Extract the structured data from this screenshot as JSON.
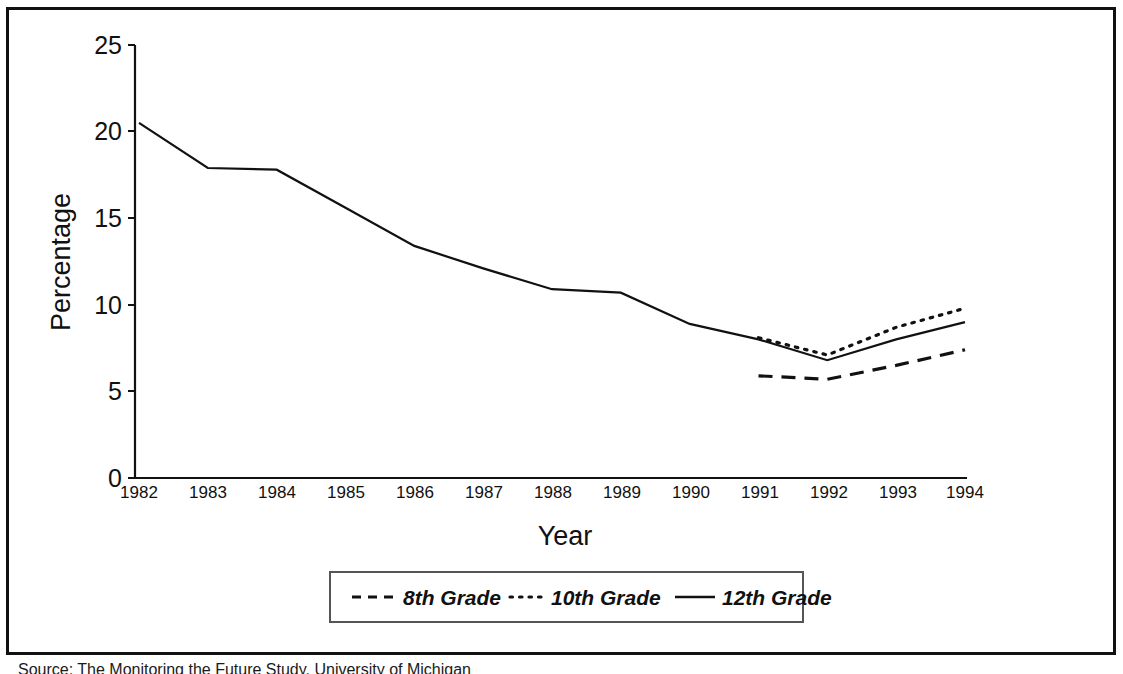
{
  "chart_data": {
    "type": "line",
    "title": "",
    "xlabel": "Year",
    "ylabel": "Percentage",
    "x": [
      1982,
      1983,
      1984,
      1985,
      1986,
      1987,
      1988,
      1989,
      1990,
      1991,
      1992,
      1993,
      1994
    ],
    "xticklabels": [
      "1982",
      "1983",
      "1984",
      "1985",
      "1986",
      "1987",
      "1988",
      "1989",
      "1990",
      "1991",
      "1992",
      "1993",
      "1994"
    ],
    "yticks": [
      0,
      5,
      10,
      15,
      20,
      25
    ],
    "yticklabels": [
      "0",
      "5",
      "10",
      "15",
      "20",
      "25"
    ],
    "ylim": [
      0,
      25
    ],
    "xlim": [
      1982,
      1994
    ],
    "grid": false,
    "legend_position": "bottom-center",
    "series": [
      {
        "name": "8th Grade",
        "style": "dashed",
        "color": "#111111",
        "x": [
          1991,
          1992,
          1993,
          1994
        ],
        "values": [
          5.9,
          5.7,
          6.5,
          7.4
        ]
      },
      {
        "name": "10th Grade",
        "style": "dotted",
        "color": "#111111",
        "x": [
          1991,
          1992,
          1993,
          1994
        ],
        "values": [
          8.1,
          7.1,
          8.7,
          9.8
        ]
      },
      {
        "name": "12th Grade",
        "style": "solid",
        "color": "#111111",
        "x": [
          1982,
          1983,
          1984,
          1985,
          1986,
          1987,
          1988,
          1989,
          1990,
          1991,
          1992,
          1993,
          1994
        ],
        "values": [
          20.5,
          17.9,
          17.8,
          15.6,
          13.4,
          12.1,
          10.9,
          10.7,
          8.9,
          8.0,
          6.8,
          8.0,
          9.0
        ]
      }
    ]
  },
  "axes": {
    "y_title": "Percentage",
    "x_title": "Year",
    "y_tick_labels": [
      "25",
      "20",
      "15",
      "10",
      "5",
      "0"
    ],
    "x_tick_labels": [
      "1982",
      "1983",
      "1984",
      "1985",
      "1986",
      "1987",
      "1988",
      "1989",
      "1990",
      "1991",
      "1992",
      "1993",
      "1994"
    ]
  },
  "legend": {
    "entries": [
      {
        "label": "8th Grade",
        "style": "dashed"
      },
      {
        "label": "10th Grade",
        "style": "dotted"
      },
      {
        "label": "12th Grade",
        "style": "solid"
      }
    ]
  },
  "footer": {
    "source": "Source:  The Monitoring the Future Study, University of Michigan"
  },
  "colors": {
    "ink": "#111111",
    "frame": "#111111",
    "background": "#ffffff"
  }
}
